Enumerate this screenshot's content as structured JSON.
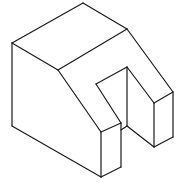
{
  "diagram": {
    "type": "isometric-drawing",
    "stroke_color": "#1a1a1a",
    "background": "#ffffff",
    "edges": [
      {
        "name": "top-back-left",
        "from": [
          12,
          43
        ],
        "to": [
          83,
          3
        ]
      },
      {
        "name": "top-back-right",
        "from": [
          83,
          3
        ],
        "to": [
          127,
          29
        ]
      },
      {
        "name": "top-front-left",
        "from": [
          12,
          43
        ],
        "to": [
          58,
          70
        ]
      },
      {
        "name": "top-ridge",
        "from": [
          58,
          70
        ],
        "to": [
          127,
          29
        ]
      },
      {
        "name": "left-vertical",
        "from": [
          12,
          43
        ],
        "to": [
          12,
          126
        ]
      },
      {
        "name": "bottom-left",
        "from": [
          12,
          126
        ],
        "to": [
          101,
          177
        ]
      },
      {
        "name": "slope-left",
        "from": [
          58,
          70
        ],
        "to": [
          101,
          132
        ]
      },
      {
        "name": "slope-right",
        "from": [
          127,
          29
        ],
        "to": [
          173,
          92
        ]
      },
      {
        "name": "front-prong-top",
        "from": [
          101,
          132
        ],
        "to": [
          121,
          123
        ]
      },
      {
        "name": "front-prong-front-left",
        "from": [
          101,
          132
        ],
        "to": [
          101,
          177
        ]
      },
      {
        "name": "front-prong-front-right",
        "from": [
          121,
          123
        ],
        "to": [
          121,
          167
        ]
      },
      {
        "name": "front-prong-bottom",
        "from": [
          101,
          177
        ],
        "to": [
          121,
          167
        ]
      },
      {
        "name": "slot-left-slope",
        "from": [
          96,
          84
        ],
        "to": [
          121,
          123
        ]
      },
      {
        "name": "slot-back-top",
        "from": [
          96,
          84
        ],
        "to": [
          127,
          67
        ]
      },
      {
        "name": "slot-back-vertical",
        "from": [
          127,
          67
        ],
        "to": [
          127,
          126
        ]
      },
      {
        "name": "slot-floor-left",
        "from": [
          121,
          130
        ],
        "to": [
          127,
          126
        ]
      },
      {
        "name": "slot-right-slope",
        "from": [
          127,
          67
        ],
        "to": [
          154,
          103
        ]
      },
      {
        "name": "slot-floor-right",
        "from": [
          127,
          126
        ],
        "to": [
          154,
          147
        ]
      },
      {
        "name": "right-prong-top",
        "from": [
          154,
          103
        ],
        "to": [
          173,
          92
        ]
      },
      {
        "name": "right-prong-front-left",
        "from": [
          154,
          103
        ],
        "to": [
          154,
          147
        ]
      },
      {
        "name": "right-prong-front-right",
        "from": [
          173,
          92
        ],
        "to": [
          173,
          137
        ]
      },
      {
        "name": "right-prong-bottom",
        "from": [
          154,
          147
        ],
        "to": [
          173,
          137
        ]
      }
    ]
  }
}
